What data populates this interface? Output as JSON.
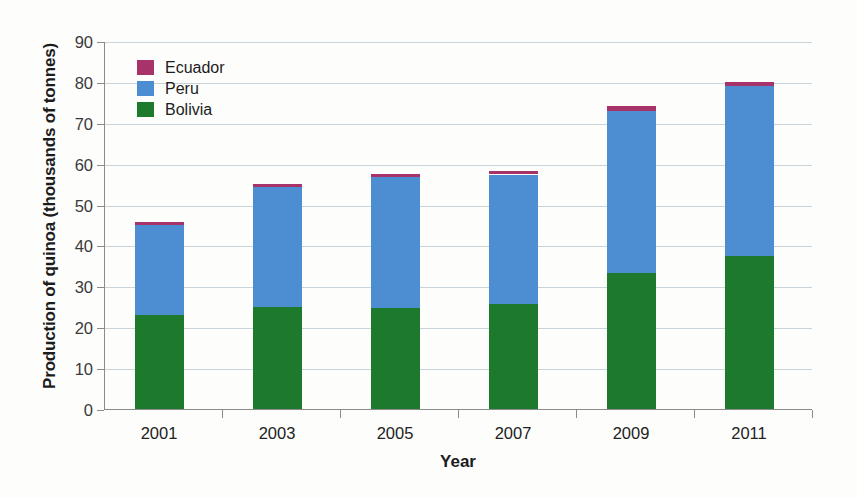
{
  "chart_data": {
    "type": "bar",
    "stacked": true,
    "title": "",
    "xlabel": "Year",
    "ylabel": "Production of quinoa (thousands of tonnes)",
    "categories": [
      "2001",
      "2003",
      "2005",
      "2007",
      "2009",
      "2011"
    ],
    "series": [
      {
        "name": "Bolivia",
        "color": "#1d7a2d",
        "values": [
          23.2,
          25.2,
          25.0,
          26.0,
          33.5,
          37.6
        ]
      },
      {
        "name": "Peru",
        "color": "#4d8ed2",
        "values": [
          22.1,
          29.3,
          32.1,
          31.6,
          39.6,
          41.6
        ]
      },
      {
        "name": "Ecuador",
        "color": "#a8336a",
        "values": [
          0.6,
          0.7,
          0.7,
          0.9,
          1.2,
          1.0
        ]
      }
    ],
    "totals": [
      45.9,
      55.2,
      57.8,
      58.5,
      74.3,
      80.2
    ],
    "ylim": [
      0,
      90
    ],
    "yticks": [
      0,
      10,
      20,
      30,
      40,
      50,
      60,
      70,
      80,
      90
    ],
    "ytick_labels": [
      "0",
      "10",
      "20",
      "30",
      "40",
      "50",
      "60",
      "70",
      "80",
      "90"
    ],
    "grid": true,
    "legend_position": "top-left",
    "legend": [
      {
        "label": "Ecuador",
        "color": "#a8336a"
      },
      {
        "label": "Peru",
        "color": "#4d8ed2"
      },
      {
        "label": "Bolivia",
        "color": "#1d7a2d"
      }
    ]
  }
}
